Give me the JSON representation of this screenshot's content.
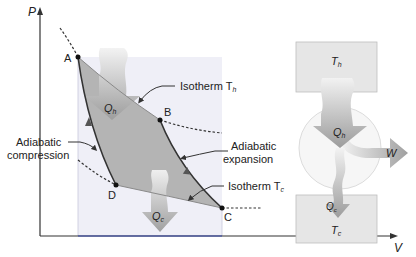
{
  "pv_diagram": {
    "axis_p_label": "P",
    "axis_v_label": "V",
    "points": {
      "A": "A",
      "B": "B",
      "C": "C",
      "D": "D"
    },
    "qh_label": "Q",
    "qh_sub": "h",
    "qc_label": "Q",
    "qc_sub": "c",
    "isotherm_h": "Isotherm T",
    "isotherm_h_sub": "h",
    "isotherm_c": "Isotherm T",
    "isotherm_c_sub": "c",
    "adiabatic_compression_line1": "Adiabatic",
    "adiabatic_compression_line2": "compression",
    "adiabatic_expansion_line1": "Adiabatic",
    "adiabatic_expansion_line2": "expansion"
  },
  "engine": {
    "hot_reservoir": "T",
    "hot_sub": "h",
    "cold_reservoir": "T",
    "cold_sub": "c",
    "qh_label": "Q",
    "qh_sub": "h",
    "qc_label": "Q",
    "qc_sub": "c",
    "work_label": "W"
  },
  "colors": {
    "cycle_fill": "#b4b4b4",
    "region_fill": "#eeeef6",
    "reservoir_fill": "#e6e6e6",
    "arrow_fill": "#9a9a9a",
    "line": "#333333"
  }
}
